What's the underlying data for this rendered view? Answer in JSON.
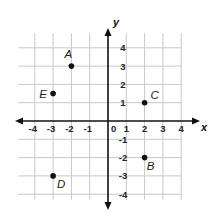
{
  "chart_data": {
    "type": "scatter",
    "title": "",
    "xlabel": "x",
    "ylabel": "y",
    "xlim": [
      -4,
      4
    ],
    "ylim": [
      -4,
      4
    ],
    "grid": true,
    "x_ticks": [
      "-4",
      "-3",
      "-2",
      "-1",
      "1",
      "2",
      "3",
      "4"
    ],
    "y_ticks": [
      "4",
      "3",
      "2",
      "1",
      "-1",
      "-2",
      "-3",
      "-4"
    ],
    "origin_label": "0",
    "points": [
      {
        "label": "A",
        "x": -2,
        "y": 3
      },
      {
        "label": "B",
        "x": 2,
        "y": -2
      },
      {
        "label": "C",
        "x": 2,
        "y": 1
      },
      {
        "label": "D",
        "x": -3,
        "y": -3
      },
      {
        "label": "E",
        "x": -3,
        "y": 1.5
      }
    ]
  },
  "colors": {
    "grid": "#c8c8c8",
    "axis": "#111111",
    "point": "#111111"
  }
}
